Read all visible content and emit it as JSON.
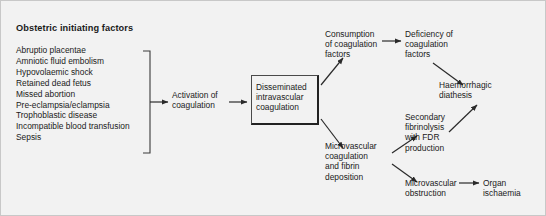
{
  "diagram": {
    "title": "Obstetric initiating factors",
    "factors": [
      "Abruptio placentae",
      "Amniotic fluid embolism",
      "Hypovolaemic shock",
      "Retained dead fetus",
      "Missed abortion",
      "Pre-eclampsia/eclampsia",
      "Trophoblastic disease",
      "Incompatible blood transfusion",
      "Sepsis"
    ],
    "nodes": {
      "activation": "Activation of\ncoagulation",
      "dic": "Disseminated\nintravascular\ncoagulation",
      "consumption": "Consumption\nof coagulation\nfactors",
      "deficiency": "Deficiency of\ncoagulation\nfactors",
      "haemorrhagic": "Haemorrhagic\ndiathesis",
      "microvascular_coagulation": "Microvascular\ncoagulation\nand fibrin\ndeposition",
      "secondary_fibrinolysis": "Secondary\nfibrinolysis\nwith FDR\nproduction",
      "microvascular_obstruction": "Microvascular\nobstruction",
      "organ_ischaemia": "Organ\nischaemia"
    },
    "colors": {
      "background": "#f2f2f2",
      "text": "#1a1a1a",
      "stroke": "#2a2a2a",
      "box_border": "#4a4a4a",
      "frame": "#c8c8c8"
    }
  }
}
